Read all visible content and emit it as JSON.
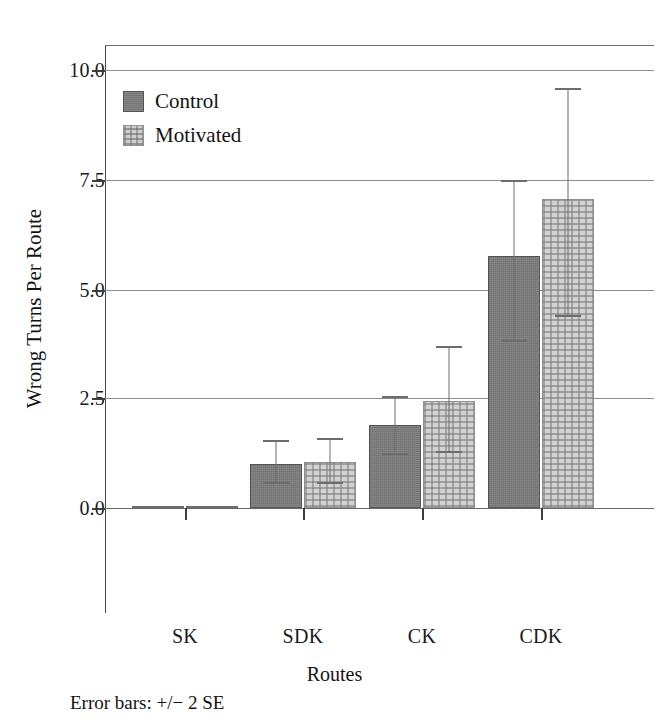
{
  "chart_data": {
    "type": "bar",
    "title": "",
    "xlabel": "Routes",
    "ylabel": "Wrong Turns Per Route",
    "categories": [
      "SK",
      "SDK",
      "CK",
      "CDK"
    ],
    "ylim": [
      -1.5,
      10.8
    ],
    "yticks": [
      0.0,
      2.5,
      5.0,
      7.5,
      10.0
    ],
    "ytick_labels": [
      "0.0",
      "2.5",
      "5.0",
      "7.5",
      "10.0"
    ],
    "grid": true,
    "legend_position": "upper left",
    "annotation": "Error bars: +/− 2 SE",
    "series": [
      {
        "name": "Control",
        "color": "#7d7d7d",
        "values": [
          0.0,
          1.0,
          1.9,
          5.75
        ],
        "err_low": [
          0.0,
          0.55,
          1.2,
          3.8
        ],
        "err_high": [
          0.0,
          1.55,
          2.55,
          7.5
        ]
      },
      {
        "name": "Motivated",
        "color": "#d2d2d2",
        "values": [
          0.0,
          1.05,
          2.45,
          7.05
        ],
        "err_low": [
          0.0,
          0.55,
          1.25,
          4.35
        ],
        "err_high": [
          0.0,
          1.6,
          3.7,
          9.6
        ]
      }
    ]
  },
  "legend": {
    "items": [
      {
        "label": "Control",
        "swatch": "control"
      },
      {
        "label": "Motivated",
        "swatch": "motivated"
      }
    ]
  },
  "axes": {
    "y_title": "Wrong Turns Per Route",
    "x_title": "Routes",
    "y_labels": [
      "10.0",
      "7.5",
      "5.0",
      "2.5",
      "0.0"
    ],
    "x_labels": [
      "SK",
      "SDK",
      "CK",
      "CDK"
    ]
  },
  "footnote": "Error bars: +/− 2 SE"
}
